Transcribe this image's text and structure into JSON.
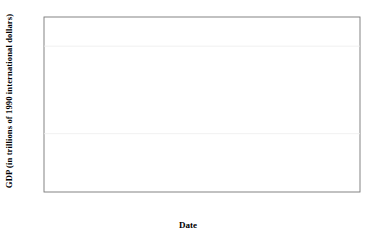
{
  "chart_data": {
    "type": "line",
    "title": "",
    "xlabel": "Date",
    "ylabel": "GDP (in trillions of 1990 international dollars)",
    "xlim": [
      1943,
      1984
    ],
    "ylim": [
      0,
      6
    ],
    "yticks": [
      0,
      1,
      2,
      3,
      4,
      5,
      6
    ],
    "xticks": [
      1943,
      1953,
      1963,
      1973,
      1983
    ],
    "xtick_labels": [
      "1943",
      "1953",
      "1963",
      "1973",
      "1983"
    ],
    "ytick_labels": [
      "0",
      "1",
      "2",
      "3",
      "4",
      "5",
      "6"
    ],
    "grid": false,
    "legend_position": "top-left-inside",
    "x": [
      1943,
      1944,
      1945,
      1946,
      1947,
      1948,
      1949,
      1950,
      1951,
      1952,
      1953,
      1954,
      1955,
      1956,
      1957,
      1958,
      1959,
      1960,
      1961,
      1962,
      1963,
      1964,
      1965,
      1966,
      1967,
      1968,
      1969,
      1970,
      1971,
      1972,
      1973,
      1974,
      1975,
      1976,
      1977,
      1978,
      1979,
      1980,
      1981,
      1982,
      1983,
      1984
    ],
    "series": [
      {
        "name": "United States",
        "style": "solid",
        "color": "#1a1a1a",
        "width": 1.6,
        "values": [
          1.55,
          1.68,
          1.7,
          1.64,
          1.42,
          1.3,
          1.3,
          1.33,
          1.35,
          1.37,
          1.34,
          1.4,
          1.48,
          1.55,
          1.6,
          1.65,
          1.68,
          1.7,
          1.74,
          1.79,
          1.84,
          1.86,
          1.85,
          1.95,
          2.05,
          2.12,
          2.22,
          2.33,
          2.45,
          2.58,
          2.72,
          2.82,
          2.95,
          3.05,
          3.06,
          3.22,
          3.38,
          3.53,
          3.54,
          3.53,
          3.78,
          3.95
        ]
      },
      {
        "name": "Western Europe",
        "style": "solid",
        "color": "#999999",
        "width": 1.6,
        "values": [
          1.33,
          1.28,
          1.18,
          1.1,
          1.05,
          1.07,
          1.14,
          1.22,
          1.3,
          1.36,
          1.42,
          1.5,
          1.58,
          1.64,
          1.71,
          1.76,
          1.83,
          1.92,
          2.0,
          2.09,
          2.17,
          2.28,
          2.38,
          2.48,
          2.58,
          2.72,
          2.87,
          3.0,
          3.12,
          3.28,
          3.48,
          3.58,
          3.58,
          3.72,
          3.85,
          3.98,
          4.12,
          4.22,
          4.28,
          4.35,
          4.48,
          4.58
        ]
      },
      {
        "name": "USSR",
        "style": "dashdot-light",
        "color": "#b3b3b3",
        "width": 1.2,
        "values": [
          0.33,
          0.33,
          0.33,
          0.34,
          0.35,
          0.37,
          0.4,
          0.43,
          0.46,
          0.49,
          0.52,
          0.56,
          0.6,
          0.64,
          0.68,
          0.72,
          0.76,
          0.8,
          0.84,
          0.87,
          0.89,
          0.94,
          0.98,
          1.02,
          1.07,
          1.12,
          1.16,
          1.22,
          1.27,
          1.3,
          1.38,
          1.42,
          1.44,
          1.49,
          1.52,
          1.56,
          1.58,
          1.62,
          1.65,
          1.68,
          1.72,
          1.76
        ]
      },
      {
        "name": "Japan",
        "style": "dashed",
        "color": "#4d4d4d",
        "width": 1.2,
        "values": [
          0.2,
          0.16,
          0.11,
          0.11,
          0.12,
          0.13,
          0.14,
          0.16,
          0.17,
          0.19,
          0.2,
          0.22,
          0.24,
          0.26,
          0.28,
          0.29,
          0.32,
          0.36,
          0.4,
          0.43,
          0.47,
          0.52,
          0.56,
          0.62,
          0.68,
          0.76,
          0.84,
          0.92,
          0.96,
          1.03,
          1.12,
          1.11,
          1.14,
          1.2,
          1.26,
          1.32,
          1.39,
          1.44,
          1.48,
          1.53,
          1.58,
          1.66
        ]
      },
      {
        "name": "Eastern Europe",
        "style": "dotted",
        "color": "#1a1a1a",
        "width": 1.5,
        "values": [
          0.22,
          0.2,
          0.16,
          0.15,
          0.16,
          0.17,
          0.18,
          0.19,
          0.2,
          0.21,
          0.22,
          0.23,
          0.24,
          0.25,
          0.26,
          0.27,
          0.28,
          0.29,
          0.3,
          0.31,
          0.32,
          0.34,
          0.36,
          0.38,
          0.4,
          0.42,
          0.44,
          0.46,
          0.48,
          0.5,
          0.53,
          0.55,
          0.57,
          0.59,
          0.61,
          0.63,
          0.65,
          0.66,
          0.67,
          0.67,
          0.68,
          0.68
        ]
      }
    ],
    "legend": [
      {
        "label": "United States",
        "style": "solid",
        "color": "#1a1a1a"
      },
      {
        "label": "USSR",
        "style": "dashdot-light",
        "color": "#b3b3b3"
      },
      {
        "label": "Western Europe",
        "style": "solid",
        "color": "#999999"
      },
      {
        "label": "Japan",
        "style": "dashed",
        "color": "#4d4d4d"
      },
      {
        "label": "Eastern Europe",
        "style": "dotted",
        "color": "#1a1a1a"
      }
    ]
  }
}
